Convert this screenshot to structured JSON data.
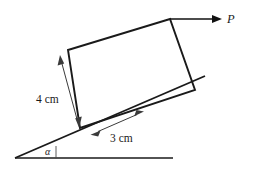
{
  "figure": {
    "kind": "free-body-diagram",
    "background_color": "#ffffff",
    "line_color": "#1a1a1a",
    "dimension_line_color": "#3a3a3a"
  },
  "labels": {
    "force": "P",
    "height_dimension": "4 cm",
    "base_dimension": "3 cm",
    "incline_angle": "α"
  },
  "geometry": {
    "ground_line": {
      "x1": 15,
      "y1": 158,
      "x2": 173,
      "y2": 158
    },
    "incline_line": {
      "x1": 15,
      "y1": 158,
      "x2": 205,
      "y2": 76
    },
    "angle_tick": {
      "x1": 56,
      "y1": 158,
      "x2": 56,
      "y2": 147
    },
    "block_corners": [
      {
        "name": "bottom-left",
        "x": 80,
        "y": 128
      },
      {
        "name": "top-left",
        "x": 68,
        "y": 50
      },
      {
        "name": "top-right",
        "x": 170,
        "y": 19
      },
      {
        "name": "bottom-right",
        "x": 195,
        "y": 90
      }
    ],
    "force_arrow": {
      "x1": 170,
      "y1": 19,
      "x2": 222,
      "y2": 19
    },
    "height_dim_arrow": {
      "x1": 60,
      "y1": 57,
      "x2": 79,
      "y2": 126
    },
    "base_dim_arrow": {
      "x1": 92,
      "y1": 134,
      "x2": 143,
      "y2": 112
    }
  },
  "label_positions": {
    "force": {
      "x": 227,
      "y": 23
    },
    "height_dimension": {
      "x": 36,
      "y": 103
    },
    "base_dimension": {
      "x": 110,
      "y": 142
    },
    "incline_angle": {
      "x": 45,
      "y": 155
    }
  }
}
